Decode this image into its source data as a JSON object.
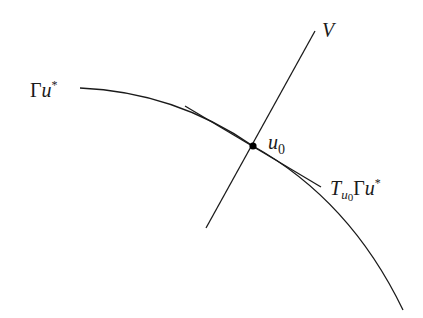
{
  "diagram": {
    "type": "geometric-illustration",
    "colors": {
      "background": "#ffffff",
      "stroke": "#1a1a1a"
    },
    "curve": {
      "name": "Gamma u star manifold curve",
      "label": {
        "symbol": "Γ",
        "variable": "u",
        "superscript": "*"
      }
    },
    "subspace": {
      "name": "V transversal line",
      "label": "V"
    },
    "point": {
      "name": "u0 intersection point",
      "label": {
        "variable": "u",
        "subscript": "0"
      }
    },
    "tangent": {
      "name": "tangent line at u0",
      "label": {
        "T": "T",
        "sub_variable": "u",
        "sub_index": "0",
        "symbol": "Γ",
        "variable": "u",
        "superscript": "*"
      }
    }
  }
}
